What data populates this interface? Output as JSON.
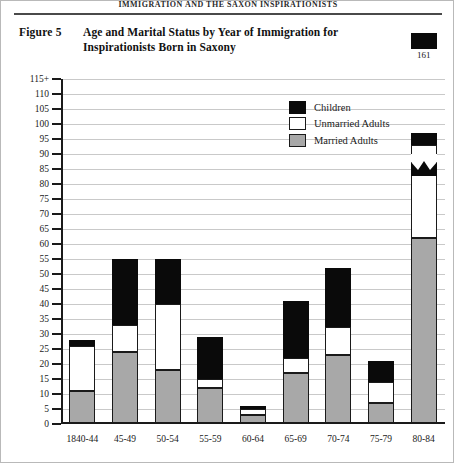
{
  "page": {
    "running_head": "IMMIGRATION AND THE SAXON INSPIRATIONISTS",
    "figure_label": "Figure 5",
    "figure_title": "Age and Marital Status by Year of Immigration for Inspirationists Born in Saxony"
  },
  "legend": {
    "items": [
      {
        "label": "Children",
        "color": "#0a0a0a",
        "key": "children"
      },
      {
        "label": "Unmarried Adults",
        "color": "#ffffff",
        "key": "unmarried"
      },
      {
        "label": "Married Adults",
        "color": "#a8a8a8",
        "key": "married"
      }
    ]
  },
  "chart_data": {
    "type": "bar",
    "subtype": "stacked",
    "title": "Age and Marital Status by Year of Immigration for Inspirationists Born in Saxony",
    "xlabel": "",
    "ylabel": "",
    "grid": true,
    "legend_position": "inside-top-right",
    "categories": [
      "1840-44",
      "45-49",
      "50-54",
      "55-59",
      "60-64",
      "65-69",
      "70-74",
      "75-79",
      "80-84"
    ],
    "ylim": [
      0,
      115
    ],
    "yticks": [
      0,
      5,
      10,
      15,
      20,
      25,
      30,
      35,
      40,
      45,
      50,
      55,
      60,
      65,
      70,
      75,
      80,
      85,
      90,
      95,
      100,
      105,
      110,
      115
    ],
    "ytick_labels": [
      "0",
      "5",
      "10",
      "15",
      "20",
      "25",
      "30",
      "35",
      "40",
      "45",
      "50",
      "55",
      "60",
      "65",
      "70",
      "75",
      "80",
      "85",
      "90",
      "95",
      "100",
      "105",
      "110",
      "115+"
    ],
    "axis_break": {
      "present": true,
      "bar_index": 8,
      "at_value": 97,
      "note": "zig-zag break on tallest bar"
    },
    "series": [
      {
        "name": "Married Adults",
        "color": "#a8a8a8",
        "values": [
          11,
          24,
          18,
          12,
          3,
          17,
          23,
          7,
          62
        ]
      },
      {
        "name": "Unmarried Adults",
        "color": "#ffffff",
        "values": [
          15,
          9,
          22,
          3,
          2,
          5,
          9.5,
          7,
          31
        ]
      },
      {
        "name": "Children",
        "color": "#0a0a0a",
        "values": [
          2,
          22,
          15,
          14,
          1,
          19,
          19.5,
          7,
          68
        ]
      }
    ],
    "totals": [
      28,
      55,
      55,
      29,
      6,
      41,
      52,
      21,
      161
    ],
    "data_labels": [
      {
        "category": "80-84",
        "value": 161,
        "text": "161"
      }
    ]
  }
}
